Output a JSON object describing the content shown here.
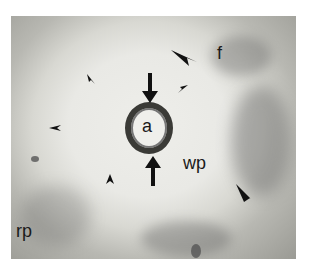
{
  "figure": {
    "type": "grayscale micrograph",
    "labels": [
      {
        "id": "a",
        "text": "a"
      },
      {
        "id": "wp",
        "text": "wp"
      },
      {
        "id": "rp",
        "text": "rp"
      },
      {
        "id": "f",
        "text": "f"
      }
    ],
    "markers": {
      "large_arrows": 2,
      "large_arrowheads": 2,
      "small_arrowheads": 4
    }
  }
}
